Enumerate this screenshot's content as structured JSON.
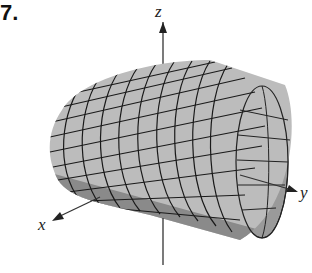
{
  "figure": {
    "number": "7.",
    "axes": {
      "x": "x",
      "y": "y",
      "z": "z"
    },
    "surface": "cylinder-mesh",
    "colors": {
      "surface_light": "#bdbdbd",
      "surface_mid": "#a8a8a8",
      "surface_dark": "#6e6e6e",
      "mesh": "#1a1a1a",
      "axis": "#333333"
    }
  }
}
